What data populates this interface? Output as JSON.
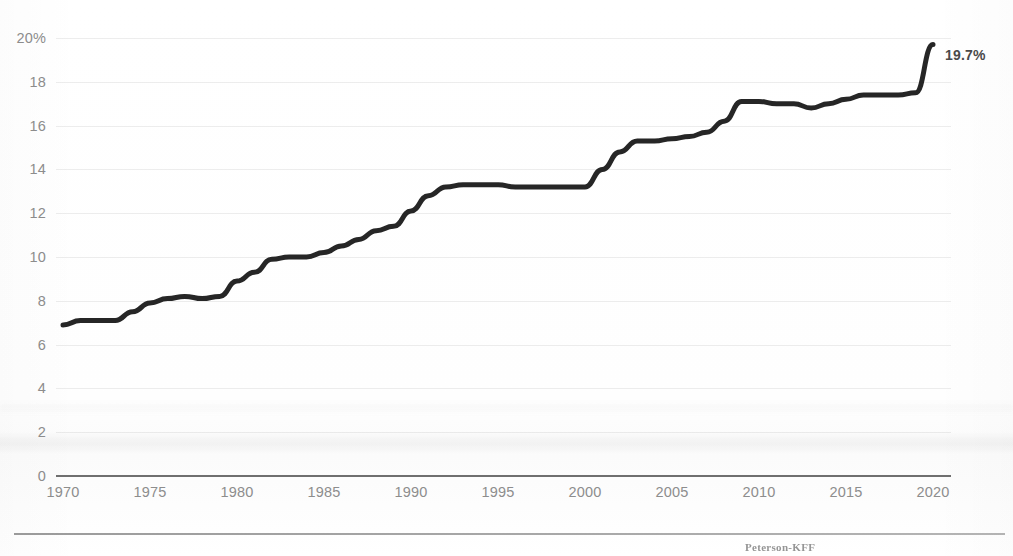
{
  "chart_data": {
    "type": "line",
    "title": "",
    "subtitle": "",
    "xlabel": "",
    "ylabel": "",
    "xlim": [
      1970,
      2020
    ],
    "ylim": [
      0,
      20
    ],
    "grid": true,
    "legend_position": "none",
    "x_tick_labels": [
      "1970",
      "1975",
      "1980",
      "1985",
      "1990",
      "1995",
      "2000",
      "2005",
      "2010",
      "2015",
      "2020"
    ],
    "x_ticks": [
      1970,
      1975,
      1980,
      1985,
      1990,
      1995,
      2000,
      2005,
      2010,
      2015,
      2020
    ],
    "y_tick_labels": [
      "20%",
      "18",
      "16",
      "14",
      "12",
      "10",
      "8",
      "6",
      "4",
      "2",
      "0"
    ],
    "y_ticks": [
      20,
      18,
      16,
      14,
      12,
      10,
      8,
      6,
      4,
      2,
      0
    ],
    "line_color": "#262626",
    "annotations": [
      {
        "name": "end-value",
        "text": "19.7%",
        "x": 2020,
        "y": 19.7
      }
    ],
    "x": [
      1970,
      1971,
      1972,
      1973,
      1974,
      1975,
      1976,
      1977,
      1978,
      1979,
      1980,
      1981,
      1982,
      1983,
      1984,
      1985,
      1986,
      1987,
      1988,
      1989,
      1990,
      1991,
      1992,
      1993,
      1994,
      1995,
      1996,
      1997,
      1998,
      1999,
      2000,
      2001,
      2002,
      2003,
      2004,
      2005,
      2006,
      2007,
      2008,
      2009,
      2010,
      2011,
      2012,
      2013,
      2014,
      2015,
      2016,
      2017,
      2018,
      2019,
      2020
    ],
    "values": [
      6.9,
      7.1,
      7.1,
      7.1,
      7.5,
      7.9,
      8.1,
      8.2,
      8.1,
      8.2,
      8.9,
      9.3,
      9.9,
      10.0,
      10.0,
      10.2,
      10.5,
      10.8,
      11.2,
      11.4,
      12.1,
      12.8,
      13.2,
      13.3,
      13.3,
      13.3,
      13.2,
      13.2,
      13.2,
      13.2,
      13.2,
      14.0,
      14.8,
      15.3,
      15.3,
      15.4,
      15.5,
      15.7,
      16.2,
      17.1,
      17.1,
      17.0,
      17.0,
      16.8,
      17.0,
      17.2,
      17.4,
      17.4,
      17.4,
      17.5,
      19.7
    ]
  },
  "footer": {
    "attribution": "Peterson-KFF"
  }
}
